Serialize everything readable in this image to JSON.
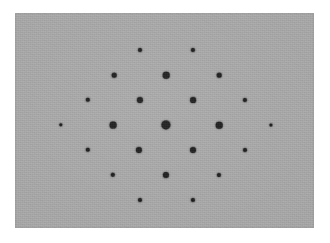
{
  "figure": {
    "canvas": {
      "width": 330,
      "height": 243,
      "background_color": "#ffffff"
    },
    "panel": {
      "name": "diffraction-panel",
      "x": 15,
      "y": 13,
      "width": 299,
      "height": 215,
      "background_color": "#a8a8a8",
      "border_color": "#9d9d9d",
      "texture": "film-grain"
    },
    "spot_color": "#181818"
  },
  "chart_data": {
    "type": "scatter",
    "subtitle": "",
    "xlabel": "",
    "ylabel": "",
    "xlim": [
      15,
      314
    ],
    "ylim": [
      13,
      228
    ],
    "grid": false,
    "legend": null,
    "annotations": [],
    "lattice": {
      "type": "centered-rectangular",
      "a_vector_px": [
        53,
        0
      ],
      "b_vector_px": [
        26.5,
        25
      ],
      "center_px": [
        166,
        125
      ],
      "rows_y_px": [
        50,
        75,
        100,
        125,
        150,
        175,
        200
      ],
      "intensity_scale": "dot diameter proportional to reflection intensity; maximum at the direct (000) beam"
    },
    "series": [
      {
        "name": "bragg-reflections",
        "marker": "filled-circle",
        "color": "#181818",
        "points": [
          {
            "id": "h0k2",
            "x": 140,
            "y": 50,
            "d": 4.0,
            "intensity": 0.33
          },
          {
            "id": "h1k2",
            "x": 193,
            "y": 50,
            "d": 4.2,
            "intensity": 0.35
          },
          {
            "id": "hm1k1",
            "x": 114,
            "y": 75,
            "d": 4.6,
            "intensity": 0.42
          },
          {
            "id": "h0k1",
            "x": 166,
            "y": 75,
            "d": 6.6,
            "intensity": 0.74
          },
          {
            "id": "h1k1",
            "x": 219,
            "y": 75,
            "d": 4.6,
            "intensity": 0.42
          },
          {
            "id": "hm2k0b",
            "x": 88,
            "y": 100,
            "d": 4.4,
            "intensity": 0.38
          },
          {
            "id": "hm1k0b",
            "x": 140,
            "y": 100,
            "d": 6.2,
            "intensity": 0.68
          },
          {
            "id": "h1k0b",
            "x": 193,
            "y": 100,
            "d": 5.8,
            "intensity": 0.62
          },
          {
            "id": "h2k0b",
            "x": 245,
            "y": 100,
            "d": 4.2,
            "intensity": 0.35
          },
          {
            "id": "hm2k0",
            "x": 61,
            "y": 125,
            "d": 3.4,
            "intensity": 0.24
          },
          {
            "id": "hm1k0",
            "x": 113,
            "y": 125,
            "d": 6.8,
            "intensity": 0.78
          },
          {
            "id": "h000",
            "x": 166,
            "y": 125,
            "d": 9.2,
            "intensity": 1.0
          },
          {
            "id": "h1k0",
            "x": 219,
            "y": 125,
            "d": 6.6,
            "intensity": 0.74
          },
          {
            "id": "h2k0",
            "x": 271,
            "y": 125,
            "d": 3.2,
            "intensity": 0.22
          },
          {
            "id": "hm2km1",
            "x": 88,
            "y": 150,
            "d": 4.4,
            "intensity": 0.38
          },
          {
            "id": "hm1km1",
            "x": 139,
            "y": 150,
            "d": 6.2,
            "intensity": 0.68
          },
          {
            "id": "h1km1",
            "x": 193,
            "y": 150,
            "d": 6.0,
            "intensity": 0.65
          },
          {
            "id": "h2km1",
            "x": 245,
            "y": 150,
            "d": 4.0,
            "intensity": 0.33
          },
          {
            "id": "hm1km2",
            "x": 113,
            "y": 175,
            "d": 4.4,
            "intensity": 0.38
          },
          {
            "id": "h0km2",
            "x": 166,
            "y": 175,
            "d": 6.2,
            "intensity": 0.68
          },
          {
            "id": "h1km2",
            "x": 219,
            "y": 175,
            "d": 4.2,
            "intensity": 0.35
          },
          {
            "id": "h0km3",
            "x": 140,
            "y": 200,
            "d": 4.0,
            "intensity": 0.33
          },
          {
            "id": "h1km3",
            "x": 193,
            "y": 200,
            "d": 4.2,
            "intensity": 0.35
          }
        ]
      }
    ]
  }
}
